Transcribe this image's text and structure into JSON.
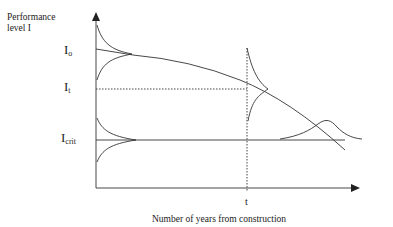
{
  "diagram": {
    "y_axis_label": "Performance level I",
    "y_axis_label_line1": "Performance",
    "y_axis_label_line2": "level I",
    "x_axis_label": "Number of years from construction",
    "levels": [
      {
        "symbol": "I",
        "subscript": "o",
        "meaning": "initial performance level"
      },
      {
        "symbol": "I",
        "subscript": "t",
        "meaning": "performance level at time t"
      },
      {
        "symbol": "I",
        "subscript": "crit",
        "meaning": "critical performance level"
      }
    ],
    "x_marker": "t",
    "curves": [
      "deterioration curve decreasing from I_o",
      "distribution of I_o on vertical axis",
      "distribution of I_t at time t",
      "distribution of I_crit on vertical axis",
      "distribution of failure time at intersection with I_crit"
    ],
    "stroke_color": "#333333"
  }
}
